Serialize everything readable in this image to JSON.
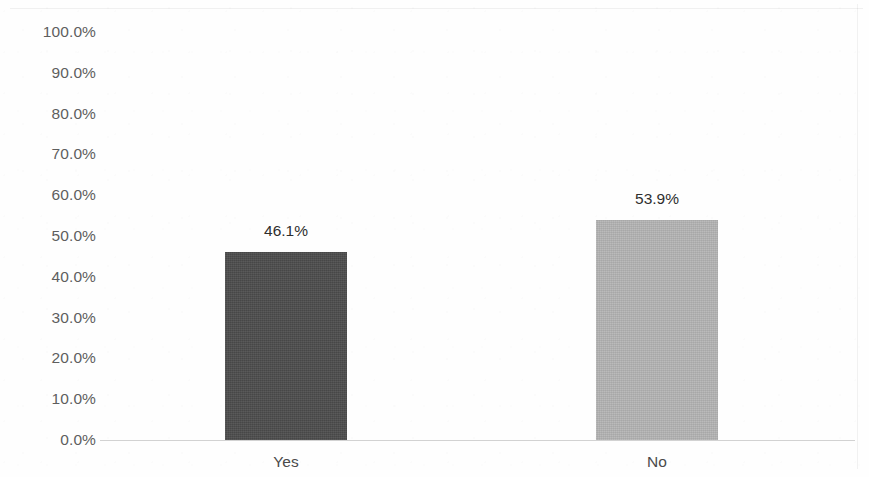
{
  "chart_data": {
    "type": "bar",
    "title": "",
    "subtitle": "",
    "xlabel": "",
    "ylabel": "",
    "categories": [
      "Yes",
      "No"
    ],
    "values": [
      46.1,
      53.9
    ],
    "value_labels": [
      "46.1%",
      "53.9%"
    ],
    "series": [
      {
        "name": "",
        "values": [
          46.1,
          53.9
        ]
      }
    ],
    "ylim": [
      0,
      100
    ],
    "y_tick_values": [
      100,
      90,
      80,
      70,
      60,
      50,
      40,
      30,
      20,
      10,
      0
    ],
    "y_tick_labels": [
      "100.0%",
      "90.0%",
      "80.0%",
      "70.0%",
      "60.0%",
      "50.0%",
      "40.0%",
      "30.0%",
      "20.0%",
      "10.0%",
      "0.0%"
    ],
    "grid": false,
    "legend": false,
    "legend_position": "none",
    "bar_colors": [
      "#4d4d4d",
      "#b5b5b5"
    ],
    "background_color": "#ffffff",
    "axis_line_color": "#d2d2d2",
    "tick_label_color": "#5e5e5e",
    "data_label_color": "#2e2e2e"
  },
  "bars": [
    {
      "category": "Yes",
      "value": 46.1,
      "value_label": "46.1%",
      "color": "#4d4d4d"
    },
    {
      "category": "No",
      "value": 53.9,
      "value_label": "53.9%",
      "color": "#b5b5b5"
    }
  ]
}
